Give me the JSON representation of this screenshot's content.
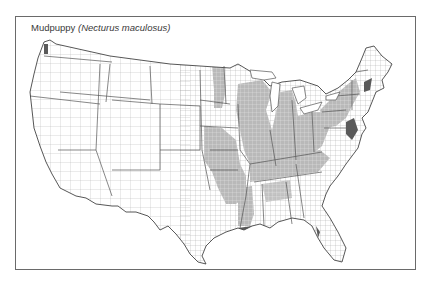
{
  "map": {
    "title_common": "Mudpuppy",
    "title_scientific": "(Necturus maculosus)",
    "region": "United States (contiguous, county boundaries)",
    "range_fill_color": "#b4b4b4",
    "dark_fill_color": "#6e6e6e",
    "outline_color": "#555555",
    "county_line_color": "#9a9a9a"
  }
}
